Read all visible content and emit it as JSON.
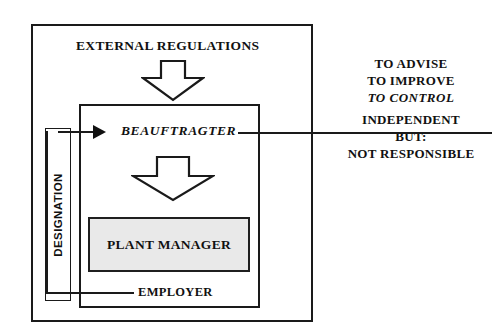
{
  "diagram": {
    "outer_frame": {
      "name": "organization-boundary"
    },
    "inner_frame": {
      "name": "plant-boundary"
    },
    "top_label": "EXTERNAL REGULATIONS",
    "role_label": "BEAUFTRAGTER",
    "plant_manager_label": "PLANT MANAGER",
    "employer_label": "EMPLOYER",
    "designation_label": "DESIGNATION",
    "arrows": [
      {
        "name": "external-regulations-down-arrow",
        "direction": "down",
        "style": "hollow-chevron"
      },
      {
        "name": "beauftragter-to-plant-manager-down-arrow",
        "direction": "down",
        "style": "hollow-chevron"
      },
      {
        "name": "designation-to-beauftragter-arrow",
        "direction": "right",
        "style": "solid-triangle"
      }
    ],
    "right_column": {
      "upper_lines": [
        "TO ADVISE",
        "TO IMPROVE",
        "TO CONTROL"
      ],
      "upper_italic_line": "TO CONTROL",
      "lower_lines": [
        "INDEPENDENT",
        "BUT:",
        "NOT RESPONSIBLE"
      ],
      "divider": true
    },
    "colors": {
      "ink": "#111111",
      "line": "#1a1a1a",
      "background": "#ffffff",
      "stipple_fill": "#e9e9e9",
      "stipple_dot": "#8e8e8e"
    }
  }
}
